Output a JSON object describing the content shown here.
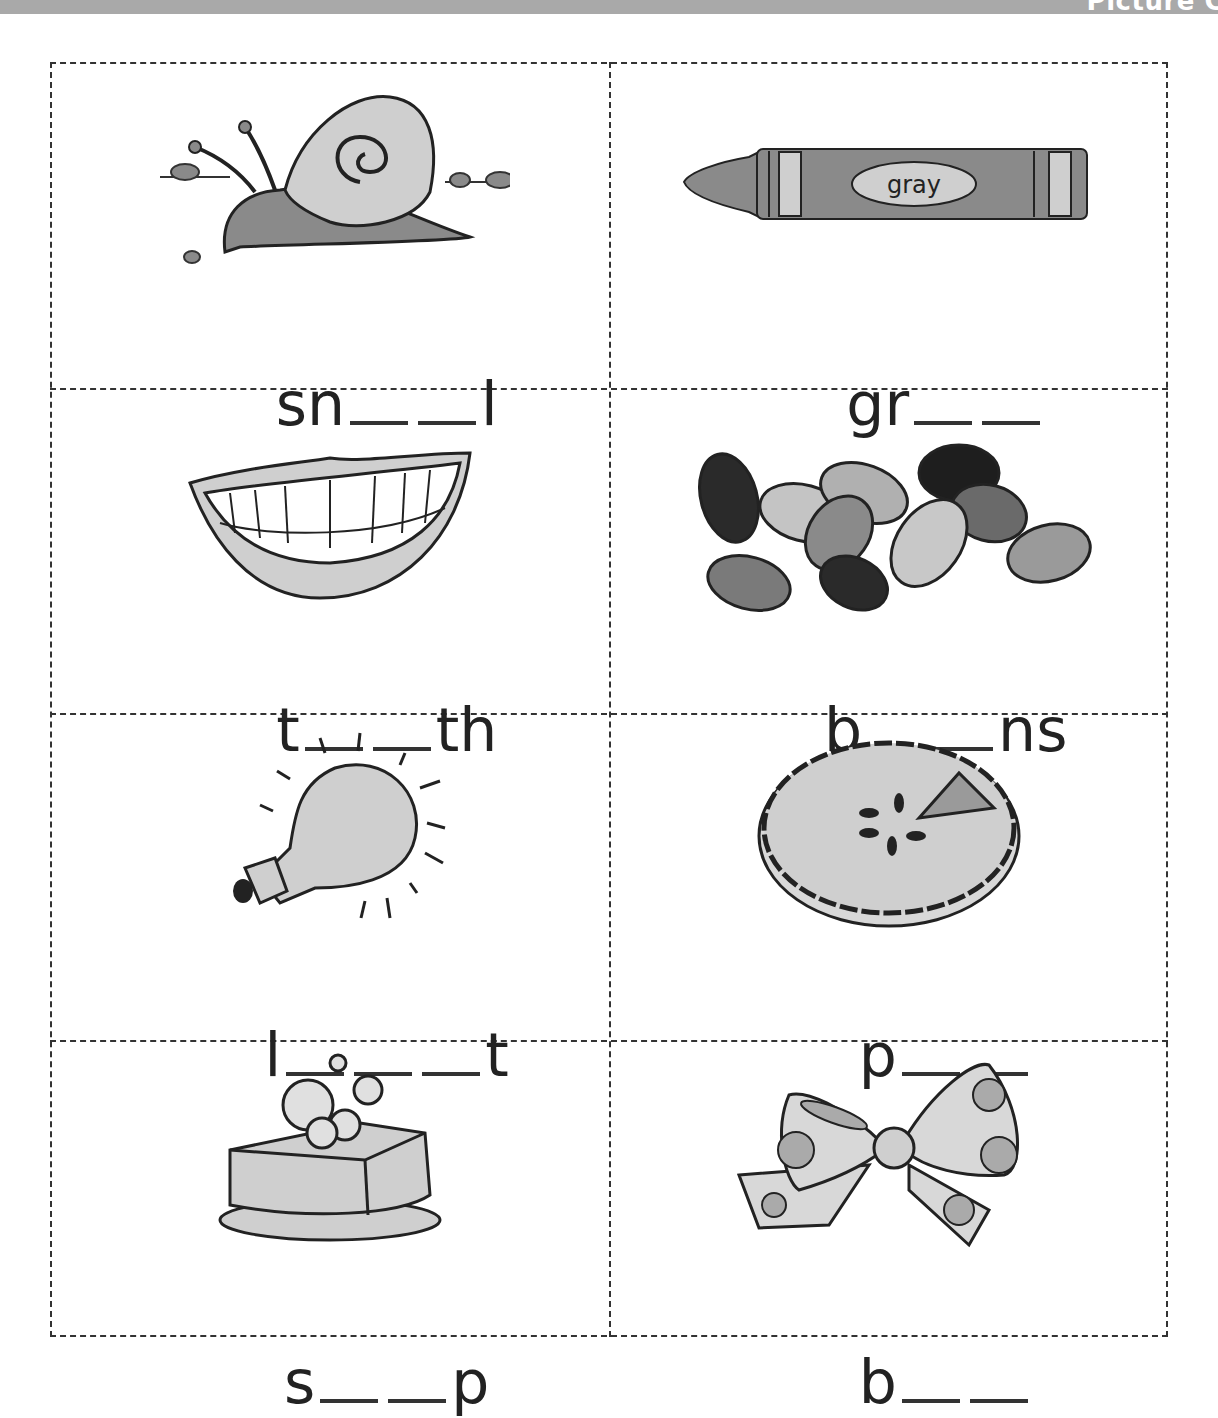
{
  "header": {
    "title_fragment": "Picture C"
  },
  "colors": {
    "header_bar": "#a9a9a9",
    "line": "#333333",
    "fill_light": "#cfcfcf",
    "fill_mid": "#8a8a8a",
    "fill_dark": "#2a2a2a"
  },
  "cards": [
    {
      "picture": "snail",
      "prefix": "sn",
      "blanks": 2,
      "suffix": "l"
    },
    {
      "picture": "gray-crayon",
      "crayon_label": "gray",
      "prefix": "gr",
      "blanks": 2,
      "suffix": ""
    },
    {
      "picture": "teeth",
      "prefix": "t",
      "blanks": 2,
      "suffix": "th"
    },
    {
      "picture": "jelly-beans",
      "prefix": "b",
      "blanks": 2,
      "suffix": "ns"
    },
    {
      "picture": "light-bulb",
      "prefix": "l",
      "blanks": 3,
      "suffix": "t"
    },
    {
      "picture": "pie",
      "prefix": "p",
      "blanks": 2,
      "suffix": ""
    },
    {
      "picture": "soap",
      "prefix": "s",
      "blanks": 2,
      "suffix": "p"
    },
    {
      "picture": "bow",
      "prefix": "b",
      "blanks": 2,
      "suffix": ""
    }
  ]
}
